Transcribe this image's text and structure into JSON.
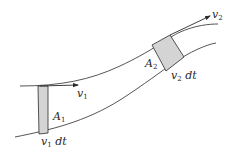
{
  "diagram": {
    "type": "fluid-flow-tube",
    "colors": {
      "stroke": "#2a2a2a",
      "fill": "#d4d4d4",
      "background": "#ffffff"
    },
    "labels": {
      "v1": {
        "base": "v",
        "sub": "1"
      },
      "v2": {
        "base": "v",
        "sub": "2"
      },
      "A1": {
        "base": "A",
        "sub": "1"
      },
      "A2": {
        "base": "A",
        "sub": "2"
      },
      "v1dt": {
        "base": "v",
        "sub": "1",
        "suffix": " dt"
      },
      "v2dt": {
        "base": "v",
        "sub": "2",
        "suffix": " dt"
      }
    }
  }
}
